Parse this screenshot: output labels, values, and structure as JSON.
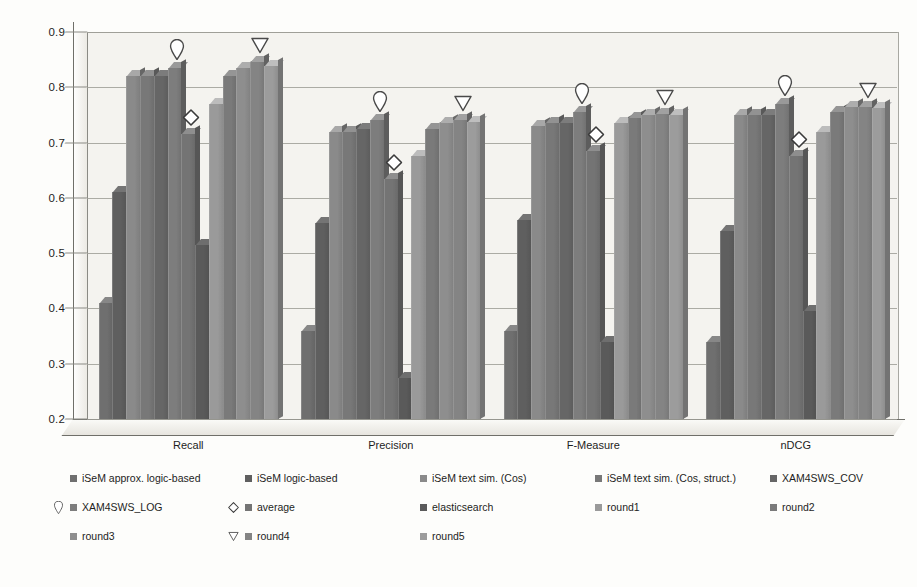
{
  "chart_data": {
    "type": "bar",
    "title": "",
    "subtitle": "",
    "xlabel": "",
    "ylabel": "",
    "categories": [
      "Recall",
      "Precision",
      "F-Measure",
      "nDCG"
    ],
    "ylim": [
      0.2,
      0.9
    ],
    "ytick_labels": [
      "0.2",
      "0.3",
      "0.4",
      "0.5",
      "0.6",
      "0.7",
      "0.8",
      "0.9"
    ],
    "ytick_values": [
      0.2,
      0.3,
      0.4,
      0.5,
      0.6,
      0.7,
      0.8,
      0.9
    ],
    "grid": true,
    "legend_position": "bottom",
    "style": "3d-grouped-column-grayscale",
    "series": [
      {
        "name": "iSeM approx. logic-based",
        "marker": "none",
        "color": "#6f6f6f",
        "values": [
          0.41,
          0.36,
          0.36,
          0.34
        ]
      },
      {
        "name": "iSeM logic-based",
        "marker": "none",
        "color": "#5f5f5f",
        "values": [
          0.61,
          0.555,
          0.56,
          0.54
        ]
      },
      {
        "name": "iSeM text sim. (Cos)",
        "marker": "none",
        "color": "#8a8a8a",
        "values": [
          0.82,
          0.72,
          0.73,
          0.75
        ]
      },
      {
        "name": "iSeM text sim. (Cos, struct.)",
        "marker": "none",
        "color": "#787878",
        "values": [
          0.82,
          0.72,
          0.735,
          0.75
        ]
      },
      {
        "name": "XAM4SWS_COV",
        "marker": "none",
        "color": "#666666",
        "values": [
          0.82,
          0.725,
          0.735,
          0.75
        ]
      },
      {
        "name": "XAM4SWS_LOG",
        "marker": "teardrop",
        "color": "#7d7d7d",
        "values": [
          0.835,
          0.74,
          0.755,
          0.77
        ]
      },
      {
        "name": "average",
        "marker": "diamond",
        "color": "#747474",
        "values": [
          0.715,
          0.635,
          0.685,
          0.675
        ]
      },
      {
        "name": "elasticsearch",
        "marker": "none",
        "color": "#5a5a5a",
        "values": [
          0.515,
          0.275,
          0.34,
          0.395
        ]
      },
      {
        "name": "round1",
        "marker": "none",
        "color": "#9a9a9a",
        "values": [
          0.77,
          0.675,
          0.735,
          0.72
        ]
      },
      {
        "name": "round2",
        "marker": "none",
        "color": "#7a7a7a",
        "values": [
          0.82,
          0.725,
          0.745,
          0.755
        ]
      },
      {
        "name": "round3",
        "marker": "none",
        "color": "#8e8e8e",
        "values": [
          0.835,
          0.735,
          0.75,
          0.765
        ]
      },
      {
        "name": "round4",
        "marker": "triangle-down",
        "color": "#848484",
        "values": [
          0.845,
          0.74,
          0.752,
          0.765
        ]
      },
      {
        "name": "round5",
        "marker": "none",
        "color": "#9c9c9c",
        "values": [
          0.838,
          0.738,
          0.75,
          0.762
        ]
      }
    ]
  },
  "legend": {
    "rows": [
      [
        {
          "label": "iSeM approx. logic-based",
          "marker": "none",
          "swatch": "#6f6f6f"
        },
        {
          "label": "iSeM logic-based",
          "marker": "none",
          "swatch": "#5f5f5f"
        },
        {
          "label": "iSeM text sim. (Cos)",
          "marker": "none",
          "swatch": "#8a8a8a"
        },
        {
          "label": "iSeM text sim. (Cos, struct.)",
          "marker": "none",
          "swatch": "#787878"
        },
        {
          "label": "XAM4SWS_COV",
          "marker": "none",
          "swatch": "#666666"
        }
      ],
      [
        {
          "label": "XAM4SWS_LOG",
          "marker": "teardrop",
          "swatch": "#7d7d7d"
        },
        {
          "label": "average",
          "marker": "diamond",
          "swatch": "#747474"
        },
        {
          "label": "elasticsearch",
          "marker": "none",
          "swatch": "#5a5a5a"
        },
        {
          "label": "round1",
          "marker": "none",
          "swatch": "#9a9a9a"
        },
        {
          "label": "round2",
          "marker": "none",
          "swatch": "#7a7a7a"
        }
      ],
      [
        {
          "label": "round3",
          "marker": "none",
          "swatch": "#8e8e8e"
        },
        {
          "label": "round4",
          "marker": "triangle-down",
          "swatch": "#848484"
        },
        {
          "label": "round5",
          "marker": "none",
          "swatch": "#9c9c9c"
        }
      ]
    ]
  }
}
